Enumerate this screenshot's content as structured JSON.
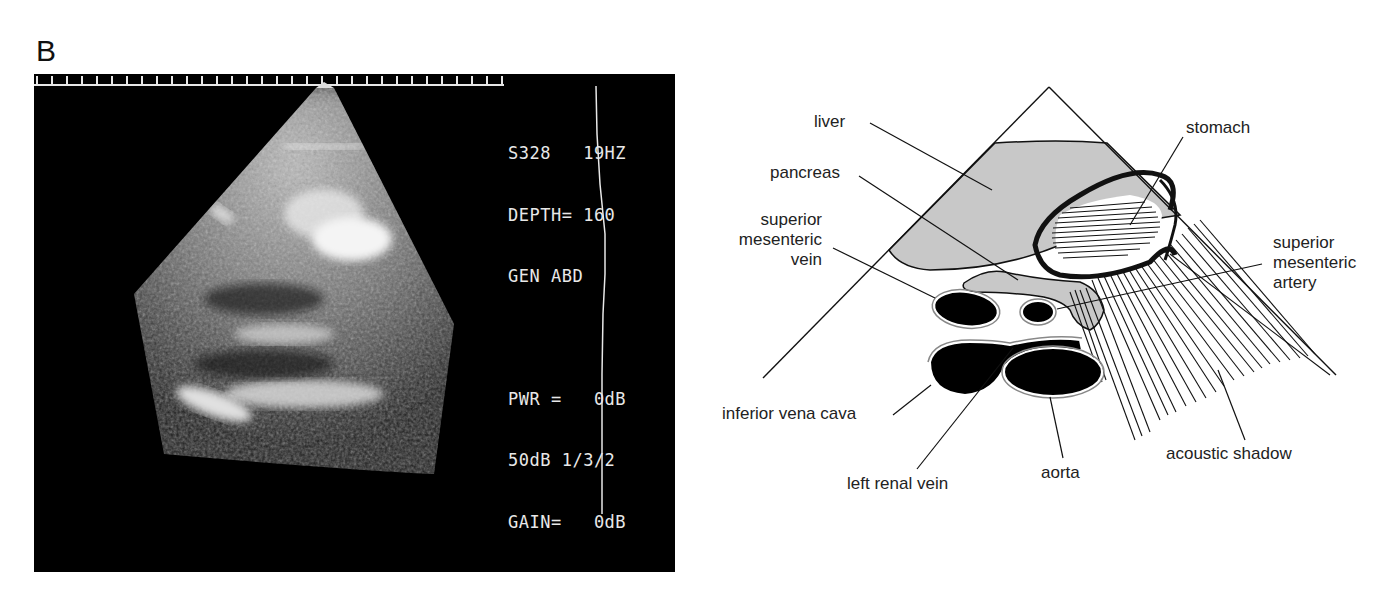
{
  "figure": {
    "panel_letter": "B"
  },
  "ultrasound": {
    "overlay": {
      "line1": "S328   19HZ",
      "line2": "DEPTH= 160",
      "line3": "GEN ABD",
      "line4": "PWR =   0dB",
      "line5": "50dB 1/3/2",
      "line6": "GAIN=   0dB"
    }
  },
  "diagram": {
    "labels": {
      "liver": "liver",
      "pancreas": "pancreas",
      "smv_1": "superior",
      "smv_2": "mesenteric",
      "smv_3": "vein",
      "stomach": "stomach",
      "sma_1": "superior",
      "sma_2": "mesenteric",
      "sma_3": "artery",
      "ivc": "inferior vena cava",
      "lrv": "left renal vein",
      "aorta": "aorta",
      "shadow": "acoustic shadow"
    },
    "colors": {
      "organ_fill": "#c8c8c8",
      "vessel_fill": "#000000",
      "line": "#111111"
    }
  }
}
